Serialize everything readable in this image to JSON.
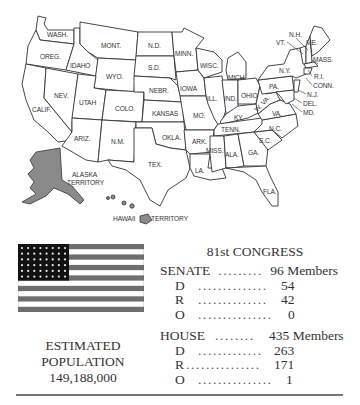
{
  "map": {
    "labels": {
      "wash": "WASH.",
      "oreg": "OREG.",
      "calif": "CALIF.",
      "idaho": "IDAHO",
      "nev": "NEV.",
      "mont": "MONT.",
      "wyo": "WYO.",
      "utah": "UTAH",
      "colo": "COLO.",
      "ariz": "ARIZ.",
      "nm": "N.M.",
      "nd": "N.D.",
      "sd": "S.D.",
      "nebr": "NEBR.",
      "kansas": "KANSAS",
      "okla": "OKLA.",
      "tex": "TEX.",
      "minn": "MINN.",
      "iowa": "IOWA",
      "mo": "MO.",
      "ark": "ARK.",
      "la": "LA.",
      "wisc": "WISC.",
      "ill": "ILL.",
      "mich": "MICH.",
      "ind": "IND.",
      "ohio": "OHIO",
      "ky": "KY.",
      "tenn": "TENN.",
      "miss": "MISS.",
      "ala": "ALA.",
      "ga": "GA.",
      "fla": "FLA.",
      "sc": "S.C.",
      "nc": "N.C.",
      "va": "VA.",
      "wva": "W. VA.",
      "pa": "PA.",
      "ny": "N.Y.",
      "vt": "VT.",
      "nh": "N.H.",
      "me": "ME.",
      "mass": "MASS.",
      "ri": "R.I.",
      "conn": "CONN.",
      "nj": "N.J.",
      "del": "DEL.",
      "md": "MD.",
      "alaska_1": "ALASKA",
      "alaska_2": "TERRITORY",
      "hawaii": "HAWAII",
      "hawaii_territory": "TERRITORY"
    }
  },
  "flag": {
    "stars": 48,
    "stripes": 13,
    "union_color": "#111111",
    "stripe_color": "#6e6e6e"
  },
  "population": {
    "line1": "ESTIMATED",
    "line2": "POPULATION",
    "value": "149,188,000"
  },
  "congress": {
    "title": "81st CONGRESS",
    "senate": {
      "label": "SENATE",
      "dots": ".........",
      "total": "96 Members",
      "rows": [
        {
          "label": "D",
          "dots": "..............",
          "value": "54"
        },
        {
          "label": "R",
          "dots": "..............",
          "value": "42"
        },
        {
          "label": "O",
          "dots": "...............",
          "value": "0"
        }
      ]
    },
    "house": {
      "label": "HOUSE",
      "dots": "........",
      "total": "435 Members",
      "rows": [
        {
          "label": "D",
          "dots": ".............",
          "value": "263"
        },
        {
          "label": "R",
          "dots": "...............",
          "value": "171"
        },
        {
          "label": "O",
          "dots": "...............",
          "value": "1"
        }
      ]
    }
  }
}
